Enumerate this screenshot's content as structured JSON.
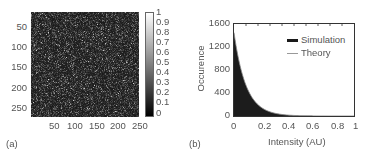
{
  "chart_data": [
    {
      "panel": "(a)",
      "type": "heatmap",
      "title": "",
      "description": "Simulated speckle intensity image, 256x256 pixels, grayscale",
      "xlabel": "",
      "ylabel": "",
      "x_ticks": [
        "50",
        "100",
        "150",
        "200",
        "250"
      ],
      "y_ticks": [
        "50",
        "100",
        "150",
        "200",
        "250"
      ],
      "xlim": [
        1,
        256
      ],
      "ylim": [
        1,
        256
      ],
      "colorbar": {
        "range": [
          0,
          1
        ],
        "ticks": [
          "0",
          "0.1",
          "0.2",
          "0.3",
          "0.4",
          "0.5",
          "0.6",
          "0.7",
          "0.8",
          "0.9",
          "1"
        ],
        "colormap": "gray"
      }
    },
    {
      "panel": "(b)",
      "type": "bar",
      "title": "",
      "xlabel": "Intensity (AU)",
      "ylabel": "Occurence",
      "xlim": [
        0,
        1
      ],
      "ylim": [
        0,
        1600
      ],
      "x_ticks": [
        "0",
        "0.2",
        "0.4",
        "0.6",
        "0.8",
        "1"
      ],
      "y_ticks": [
        "0",
        "400",
        "800",
        "1200",
        "1600"
      ],
      "legend": [
        "Simulation",
        "Theory"
      ],
      "legend_position": "upper right",
      "series": [
        {
          "name": "Simulation",
          "kind": "histogram",
          "x": [
            0.0,
            0.025,
            0.05,
            0.075,
            0.1,
            0.125,
            0.15,
            0.175,
            0.2,
            0.25,
            0.3,
            0.35,
            0.4,
            0.5
          ],
          "values": [
            1450,
            1150,
            900,
            700,
            550,
            420,
            330,
            260,
            200,
            120,
            70,
            40,
            20,
            5
          ]
        },
        {
          "name": "Theory",
          "kind": "line",
          "x": [
            0.0,
            0.1,
            0.2,
            0.3,
            0.4,
            0.5
          ],
          "values": [
            1450,
            550,
            200,
            70,
            25,
            5
          ]
        }
      ]
    }
  ],
  "panel_a": {
    "label": "(a)",
    "y_ticks": [
      "50",
      "100",
      "150",
      "200",
      "250"
    ],
    "x_ticks": [
      "50",
      "100",
      "150",
      "200",
      "250"
    ],
    "colorbar_ticks": [
      "1",
      "0.9",
      "0.8",
      "0.7",
      "0.6",
      "0.5",
      "0.4",
      "0.3",
      "0.2",
      "0.1",
      "0"
    ]
  },
  "panel_b": {
    "label": "(b)",
    "xlabel": "Intensity (AU)",
    "ylabel": "Occurence",
    "y_ticks": [
      "1600",
      "1200",
      "800",
      "400",
      "0"
    ],
    "x_ticks": [
      "0",
      "0.2",
      "0.4",
      "0.6",
      "0.8",
      "1"
    ],
    "legend": {
      "simulation": "Simulation",
      "theory": "Theory",
      "simulation_color": "#1a1a1a",
      "theory_color": "#999999"
    }
  }
}
